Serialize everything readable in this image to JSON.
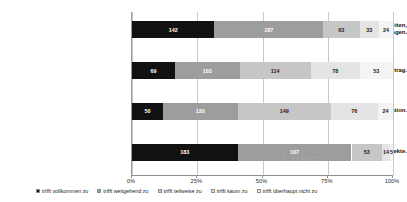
{
  "chart_data": {
    "type": "bar",
    "orientation": "horizontal",
    "stacked": true,
    "stack_mode": "percent",
    "title": "",
    "subtitle": "",
    "xlabel": "",
    "ylabel": "",
    "xlim": [
      0,
      100
    ],
    "xticks": [
      "0%",
      "25%",
      "50%",
      "75%",
      "100%"
    ],
    "xtick_values": [
      0,
      25,
      50,
      75,
      100
    ],
    "grid": true,
    "legend_position": "bottom",
    "categories": [
      "...meine Fähigkeiten,\nmeine eigene Arbeitszeit zu managen.",
      "...meinen Arbeitsvertrag.",
      "...die Linie/Organisation.",
      "...meine Projekte."
    ],
    "series": [
      {
        "name": "trifft vollkommen zu",
        "color": "#111111",
        "values": [
          142,
          69,
          50,
          183
        ]
      },
      {
        "name": "trifft weitgehend zu",
        "color": "#9d9d9d",
        "values": [
          187,
          103,
          120,
          197
        ]
      },
      {
        "name": "trifft teilweise zu",
        "color": "#c6c6c6",
        "values": [
          63,
          114,
          149,
          53
        ]
      },
      {
        "name": "trifft kaum zu",
        "color": "#e4e4e4",
        "values": [
          33,
          78,
          76,
          14
        ]
      },
      {
        "name": "trifft überhaupt nicht zu",
        "color": "#f4f4f4",
        "values": [
          24,
          53,
          24,
          5
        ]
      }
    ],
    "rows": [
      {
        "label": "...meine Fähigkeiten,\nmeine eigene Arbeitszeit zu managen.",
        "total": 449,
        "segments": [
          {
            "value": "142",
            "pct": 31.6
          },
          {
            "value": "187",
            "pct": 41.6
          },
          {
            "value": "63",
            "pct": 14.0
          },
          {
            "value": "33",
            "pct": 7.4
          },
          {
            "value": "24",
            "pct": 5.4
          }
        ]
      },
      {
        "label": "...meinen Arbeitsvertrag.",
        "total": 417,
        "segments": [
          {
            "value": "69",
            "pct": 16.5
          },
          {
            "value": "103",
            "pct": 24.7
          },
          {
            "value": "114",
            "pct": 27.3
          },
          {
            "value": "78",
            "pct": 18.7
          },
          {
            "value": "53",
            "pct": 12.8
          }
        ]
      },
      {
        "label": "...die Linie/Organisation.",
        "total": 419,
        "segments": [
          {
            "value": "50",
            "pct": 11.9
          },
          {
            "value": "120",
            "pct": 28.6
          },
          {
            "value": "149",
            "pct": 35.6
          },
          {
            "value": "76",
            "pct": 18.1
          },
          {
            "value": "24",
            "pct": 5.8
          }
        ]
      },
      {
        "label": "...meine Projekte.",
        "total": 452,
        "segments": [
          {
            "value": "183",
            "pct": 40.5
          },
          {
            "value": "197",
            "pct": 43.6
          },
          {
            "value": "53",
            "pct": 11.7
          },
          {
            "value": "14",
            "pct": 3.1
          },
          {
            "value": "5",
            "pct": 1.1
          }
        ]
      }
    ]
  },
  "legend": {
    "items": [
      {
        "label": "trifft vollkommen zu"
      },
      {
        "label": "trifft weitgehend zu"
      },
      {
        "label": "trifft teilweise zu"
      },
      {
        "label": "trifft kaum zu"
      },
      {
        "label": "trifft überhaupt nicht zu"
      }
    ]
  },
  "watermark": {
    "text": "LUNG"
  }
}
